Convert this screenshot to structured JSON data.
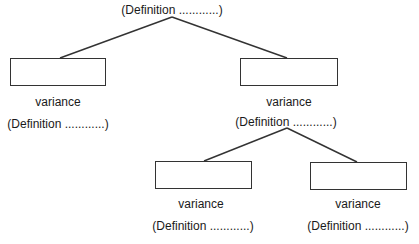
{
  "diagram": {
    "type": "tree",
    "root": {
      "definition": "(Definition ............)"
    },
    "nodes": [
      {
        "id": "left",
        "label": "variance",
        "definition": "(Definition ............)"
      },
      {
        "id": "right",
        "label": "variance",
        "definition": "(Definition ............)"
      },
      {
        "id": "right-left",
        "label": "variance",
        "definition": "(Definition ............)"
      },
      {
        "id": "right-right",
        "label": "variance",
        "definition": "(Definition ............)"
      }
    ],
    "edges": [
      [
        "root",
        "left"
      ],
      [
        "root",
        "right"
      ],
      [
        "right",
        "right-left"
      ],
      [
        "right",
        "right-right"
      ]
    ],
    "colors": {
      "line": "#333333",
      "text": "#1a1a1a",
      "background": "#ffffff"
    }
  }
}
